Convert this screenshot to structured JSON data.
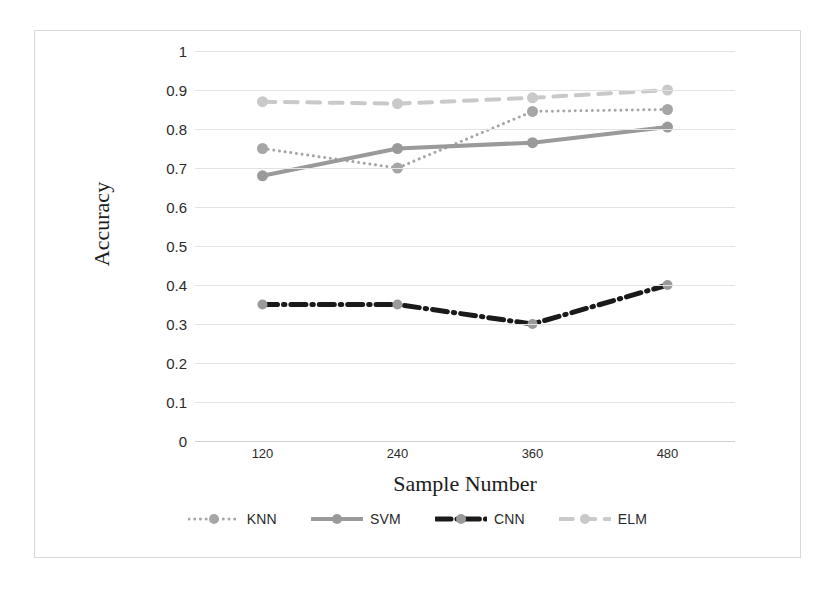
{
  "chart_data": {
    "type": "line",
    "title": "",
    "xlabel": "Sample Number",
    "ylabel": "Accuracy",
    "categories": [
      "120",
      "240",
      "360",
      "480"
    ],
    "x": [
      120,
      240,
      360,
      480
    ],
    "xlim": [
      60,
      540
    ],
    "ylim": [
      0,
      1
    ],
    "ytick_labels": [
      "1",
      "0.9",
      "0.8",
      "0.7",
      "0.6",
      "0.5",
      "0.4",
      "0.3",
      "0.2",
      "0.1",
      "0"
    ],
    "ytick_values": [
      1,
      0.9,
      0.8,
      0.7,
      0.6,
      0.5,
      0.4,
      0.3,
      0.2,
      0.1,
      0
    ],
    "grid": true,
    "legend_position": "bottom",
    "series": [
      {
        "name": "KNN",
        "values": [
          0.75,
          0.7,
          0.845,
          0.85
        ],
        "color": "#a6a6a6",
        "style": "dotted",
        "width": 3,
        "marker": "circle"
      },
      {
        "name": "SVM",
        "values": [
          0.68,
          0.75,
          0.765,
          0.805
        ],
        "color": "#9a9a9a",
        "style": "solid",
        "width": 4,
        "marker": "circle"
      },
      {
        "name": "CNN",
        "values": [
          0.35,
          0.35,
          0.3,
          0.4
        ],
        "color": "#1a1a1a",
        "style": "dashdot",
        "width": 5,
        "marker": "circle"
      },
      {
        "name": "ELM",
        "values": [
          0.87,
          0.865,
          0.88,
          0.9
        ],
        "color": "#c9c9c9",
        "style": "dashed",
        "width": 4,
        "marker": "circle"
      }
    ]
  },
  "figure": {
    "border_color": "#d8d8d8",
    "background": "#ffffff",
    "gridline_color": "#e3e3e3"
  }
}
